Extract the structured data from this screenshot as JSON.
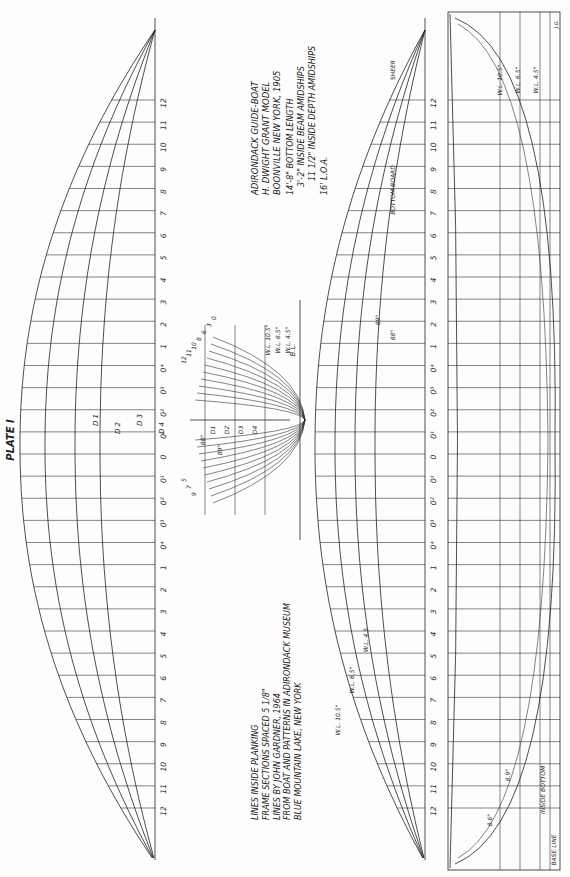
{
  "plate_title": "PLATE I",
  "title_block": {
    "lines": [
      "ADIRONDACK GUIDE-BOAT",
      "H. DWIGHT GRANT MODEL",
      "BOONVILLE NEW YORK, 1905",
      "14'-8\" BOTTOM LENGTH",
      "3'-2\" INSIDE BEAM AMIDSHIPS",
      "11 1/2\" INSIDE DEPTH AMIDSHIPS",
      "16' L.O.A."
    ]
  },
  "notes_block": {
    "lines": [
      "LINES INSIDE PLANKING",
      "FRAME SECTIONS SPACED 5 1/8\"",
      "LINES BY JOHN GARDNER, 1964",
      "FROM BOAT AND PATTERNS IN ADIRONDACK MUSEUM",
      "BLUE MOUNTAIN LAKE, NEW YORK"
    ]
  },
  "stations": [
    "12",
    "11",
    "10",
    "9",
    "8",
    "7",
    "6",
    "5",
    "4",
    "3",
    "2",
    "1",
    "0⁴",
    "0³",
    "0²",
    "0¹",
    "0",
    "0¹",
    "0²",
    "0³",
    "0⁴",
    "1",
    "2",
    "3",
    "4",
    "5",
    "6",
    "7",
    "8",
    "9",
    "10",
    "11",
    "12"
  ],
  "diagonals": [
    "D 1",
    "D 2",
    "D 3",
    "D 4"
  ],
  "body_plan": {
    "station_labels_left": [
      "5",
      "7",
      "9"
    ],
    "station_labels_right": [
      "12",
      "11",
      "10",
      "8",
      "6",
      "3",
      "0"
    ],
    "diagonal_labels": [
      "D1",
      "D2",
      "D3",
      "D4"
    ],
    "angles": [
      "88°",
      "89°"
    ],
    "waterlines": [
      "W.L. 10.5\"",
      "W.L. 6.5\"",
      "W.L. 4.5\""
    ],
    "baseline_label": "B.L."
  },
  "half_breadth": {
    "waterline_labels": [
      "W.L. 10.5\"",
      "W.L. 6.5\"",
      "W.L. 4.5"
    ],
    "angle_labels": [
      "89°",
      "88°"
    ],
    "sheer_label": "SHEER",
    "bottom_label": "BOTTOM BOARD"
  },
  "profile": {
    "waterline_labels": [
      "W.L. 10.5\"",
      "W.L. 6.5\"",
      "W.L. 4.5\""
    ],
    "angle_labels": [
      "8.6°",
      "8.9°"
    ],
    "inside_bottom_label": "INSIDE BOTTOM",
    "base_line_label": "BASE LINE",
    "initials": "J.G."
  }
}
